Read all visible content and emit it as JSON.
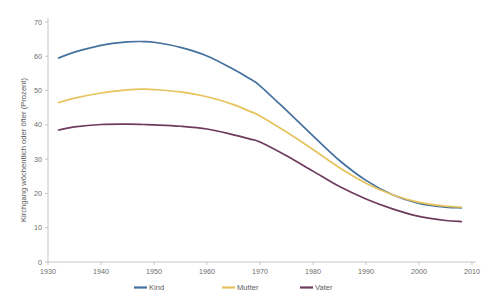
{
  "chart_data": {
    "type": "line",
    "title": "",
    "subtitle": "",
    "xlabel": "",
    "ylabel": "Kirchgang wöchentlich oder öfter (Prozent)",
    "xlim": [
      1930,
      2010
    ],
    "ylim": [
      0,
      70
    ],
    "xticks": [
      1930,
      1940,
      1950,
      1960,
      1970,
      1980,
      1990,
      2000,
      2010
    ],
    "yticks": [
      0,
      10,
      20,
      30,
      40,
      50,
      60,
      70
    ],
    "xtick_labels": [
      "1930",
      "1940",
      "1950",
      "1960",
      "1970",
      "1980",
      "1990",
      "2000",
      "2010"
    ],
    "ytick_labels": [
      "0",
      "10",
      "20",
      "30",
      "40",
      "50",
      "60",
      "70"
    ],
    "grid": false,
    "legend_position": "bottom",
    "x": [
      1932,
      1935,
      1940,
      1945,
      1948,
      1950,
      1955,
      1960,
      1965,
      1968,
      1970,
      1975,
      1980,
      1985,
      1990,
      1995,
      2000,
      2005,
      2008
    ],
    "series": [
      {
        "name": "Kind",
        "color": "#44719f",
        "values": [
          59.5,
          61.2,
          63.2,
          64.2,
          64.3,
          64.1,
          62.6,
          60.1,
          56.2,
          53.5,
          51.4,
          44.2,
          36.8,
          29.6,
          23.8,
          19.6,
          17.1,
          16.0,
          15.8
        ]
      },
      {
        "name": "Mutter",
        "color": "#e6c35c",
        "values": [
          46.5,
          47.8,
          49.3,
          50.2,
          50.4,
          50.3,
          49.6,
          48.2,
          45.9,
          44.0,
          42.6,
          37.9,
          32.8,
          27.5,
          23.0,
          19.6,
          17.4,
          16.3,
          16.0
        ]
      },
      {
        "name": "Vater",
        "color": "#6e3a5e",
        "values": [
          38.5,
          39.4,
          40.1,
          40.2,
          40.1,
          40.0,
          39.6,
          38.8,
          37.1,
          35.9,
          35.0,
          31.0,
          26.5,
          22.0,
          18.4,
          15.5,
          13.3,
          12.1,
          11.8
        ]
      }
    ]
  },
  "legend": {
    "items": [
      {
        "label": "Kind",
        "color": "#44719f"
      },
      {
        "label": "Mutter",
        "color": "#e6c35c"
      },
      {
        "label": "Vater",
        "color": "#6e3a5e"
      }
    ]
  }
}
